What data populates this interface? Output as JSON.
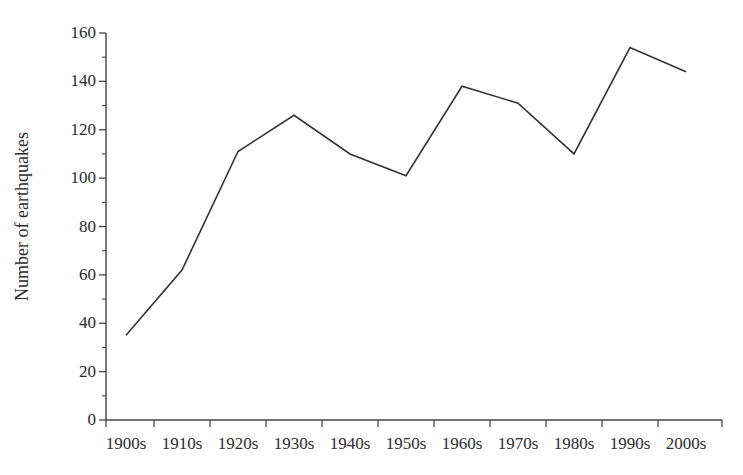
{
  "chart_data": {
    "type": "line",
    "title": "",
    "subtitle": "",
    "xlabel": "",
    "ylabel": "Number of earthquakes",
    "categories": [
      "1900s",
      "1910s",
      "1920s",
      "1930s",
      "1940s",
      "1950s",
      "1960s",
      "1970s",
      "1980s",
      "1990s",
      "2000s"
    ],
    "values": [
      35,
      62,
      111,
      126,
      110,
      101,
      138,
      131,
      110,
      154,
      144
    ],
    "series": [
      {
        "name": "Number of earthquakes",
        "values": [
          35,
          62,
          111,
          126,
          110,
          101,
          138,
          131,
          110,
          154,
          144
        ]
      }
    ],
    "ylim": [
      0,
      160
    ],
    "yticks": [
      0,
      20,
      40,
      60,
      80,
      100,
      120,
      140,
      160
    ],
    "ytick_labels": [
      "0",
      "20",
      "40",
      "60",
      "80",
      "100",
      "120",
      "140",
      "160"
    ],
    "yminor_ticks": [
      10,
      30,
      50,
      70,
      90,
      110,
      130,
      150
    ],
    "xtick_labels": [
      "1900s",
      "1910s",
      "1920s",
      "1930s",
      "1940s",
      "1950s",
      "1960s",
      "1970s",
      "1980s",
      "1990s",
      "2000s"
    ],
    "grid": false,
    "legend": false,
    "legend_position": "none",
    "line_color": "#333333",
    "axis_color": "#444444",
    "background_color": "#ffffff",
    "line_width": 1.6,
    "markers": false
  }
}
